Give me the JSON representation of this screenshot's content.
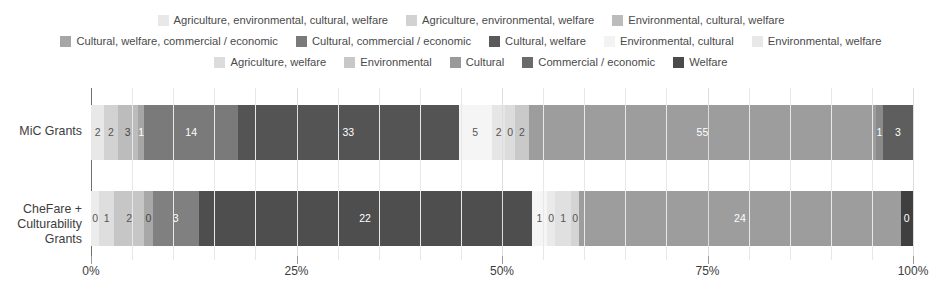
{
  "legend": {
    "rows": [
      [
        {
          "label": "Agriculture, environmental, cultural, welfare",
          "color": "#e8e8e8"
        },
        {
          "label": "Agriculture, environmental, welfare",
          "color": "#d2d2d2"
        },
        {
          "label": "Environmental, cultural, welfare",
          "color": "#bcbcbc"
        }
      ],
      [
        {
          "label": "Cultural, welfare, commercial / economic",
          "color": "#a6a6a6"
        },
        {
          "label": "Cultural, commercial / economic",
          "color": "#7a7a7a"
        },
        {
          "label": "Cultural, welfare",
          "color": "#5a5a5a"
        },
        {
          "label": "Environmental, cultural",
          "color": "#f3f3f3"
        },
        {
          "label": "Environmental, welfare",
          "color": "#e8e8e8"
        }
      ],
      [
        {
          "label": "Agriculture, welfare",
          "color": "#dcdcdc"
        },
        {
          "label": "Environmental",
          "color": "#c8c8c8"
        },
        {
          "label": "Cultural",
          "color": "#9a9a9a"
        },
        {
          "label": "Commercial / economic",
          "color": "#6a6a6a"
        },
        {
          "label": "Welfare",
          "color": "#4a4a4a"
        }
      ]
    ]
  },
  "axis": {
    "y_labels": [
      "MiC Grants",
      "CheFare + Culturability Grants"
    ],
    "x_ticks": [
      "0%",
      "25%",
      "50%",
      "75%",
      "100%"
    ]
  },
  "chart_data": {
    "type": "bar",
    "orientation": "horizontal",
    "stacked": true,
    "normalized": true,
    "title": "",
    "xlabel": "",
    "ylabel": "",
    "xlim": [
      0,
      100
    ],
    "grid": true,
    "legend_position": "top",
    "categories": [
      "MiC Grants",
      "CheFare + Culturability Grants"
    ],
    "series": [
      {
        "name": "Agriculture, environmental, cultural, welfare",
        "color": "#e8e8e8",
        "values": [
          2,
          0
        ]
      },
      {
        "name": "Agriculture, environmental, welfare",
        "color": "#d2d2d2",
        "values": [
          2,
          1
        ]
      },
      {
        "name": "Environmental, cultural, welfare",
        "color": "#bcbcbc",
        "values": [
          3,
          2
        ]
      },
      {
        "name": "Cultural, welfare, commercial / economic",
        "color": "#a6a6a6",
        "values": [
          1,
          0
        ]
      },
      {
        "name": "Cultural, commercial / economic",
        "color": "#7a7a7a",
        "values": [
          14,
          3
        ]
      },
      {
        "name": "Cultural, welfare",
        "color": "#5a5a5a",
        "values": [
          33,
          22
        ]
      },
      {
        "name": "Environmental, cultural",
        "color": "#f3f3f3",
        "values": [
          5,
          1
        ]
      },
      {
        "name": "Environmental, welfare",
        "color": "#e8e8e8",
        "values": [
          2,
          0
        ]
      },
      {
        "name": "Agriculture, welfare",
        "color": "#dcdcdc",
        "values": [
          0,
          1
        ]
      },
      {
        "name": "Environmental",
        "color": "#c8c8c8",
        "values": [
          2,
          0
        ]
      },
      {
        "name": "Cultural",
        "color": "#9a9a9a",
        "values": [
          55,
          24
        ]
      },
      {
        "name": "Commercial / economic",
        "color": "#6a6a6a",
        "values": [
          1,
          0
        ]
      },
      {
        "name": "Welfare",
        "color": "#4a4a4a",
        "values": [
          3,
          0
        ]
      }
    ]
  },
  "bars": [
    {
      "name": "MiC Grants",
      "segments": [
        {
          "label": "2",
          "value": 2,
          "color": "#e8e8e8",
          "text": "#555555",
          "pct": 1.626
        },
        {
          "label": "2",
          "value": 2,
          "color": "#d2d2d2",
          "text": "#555555",
          "pct": 1.626
        },
        {
          "label": "3",
          "value": 3,
          "color": "#bcbcbc",
          "text": "#444444",
          "pct": 2.439
        },
        {
          "label": "1",
          "value": 1,
          "color": "#a6a6a6",
          "text": "#ffffff",
          "pct": 0.813
        },
        {
          "label": "14",
          "value": 14,
          "color": "#7a7a7a",
          "text": "#ffffff",
          "pct": 11.382
        },
        {
          "label": "33",
          "value": 33,
          "color": "#545454",
          "text": "#ffffff",
          "pct": 26.829
        },
        {
          "label": "5",
          "value": 5,
          "color": "#f5f5f5",
          "text": "#555555",
          "pct": 4.065
        },
        {
          "label": "2",
          "value": 2,
          "color": "#e6e6e6",
          "text": "#555555",
          "pct": 1.626
        },
        {
          "label": "0",
          "value": 0,
          "color": "#dcdcdc",
          "text": "#555555",
          "pct": 1.22
        },
        {
          "label": "2",
          "value": 2,
          "color": "#c9c9c9",
          "text": "#555555",
          "pct": 1.626
        },
        {
          "label": "55",
          "value": 55,
          "color": "#9d9d9d",
          "text": "#ffffff",
          "pct": 42.276
        },
        {
          "label": "1",
          "value": 1,
          "color": "#8a8a8a",
          "text": "#ffffff",
          "pct": 0.813
        },
        {
          "label": "3",
          "value": 3,
          "color": "#5e5e5e",
          "text": "#ffffff",
          "pct": 3.659
        }
      ]
    },
    {
      "name": "CheFare + Culturability Grants",
      "segments": [
        {
          "label": "0",
          "value": 0,
          "color": "#ececec",
          "text": "#555555",
          "pct": 1.0
        },
        {
          "label": "1",
          "value": 1,
          "color": "#dedede",
          "text": "#555555",
          "pct": 1.8
        },
        {
          "label": "2",
          "value": 2,
          "color": "#c6c6c6",
          "text": "#555555",
          "pct": 3.7
        },
        {
          "label": "0",
          "value": 0,
          "color": "#a8a8a8",
          "text": "#444444",
          "pct": 1.0
        },
        {
          "label": "3",
          "value": 3,
          "color": "#808080",
          "text": "#ffffff",
          "pct": 5.6
        },
        {
          "label": "22",
          "value": 22,
          "color": "#4e4e4e",
          "text": "#ffffff",
          "pct": 40.5
        },
        {
          "label": "1",
          "value": 1,
          "color": "#f5f5f5",
          "text": "#555555",
          "pct": 1.9
        },
        {
          "label": "0",
          "value": 0,
          "color": "#eaeaea",
          "text": "#555555",
          "pct": 1.0
        },
        {
          "label": "1",
          "value": 1,
          "color": "#e0e0e0",
          "text": "#555555",
          "pct": 1.9
        },
        {
          "label": "0",
          "value": 0,
          "color": "#d4d4d4",
          "text": "#555555",
          "pct": 1.0
        },
        {
          "label": "24",
          "value": 24,
          "color": "#9d9d9d",
          "text": "#ffffff",
          "pct": 39.1
        },
        {
          "label": "0",
          "value": 0,
          "color": "#3f3f3f",
          "text": "#ffffff",
          "pct": 1.5
        }
      ]
    }
  ]
}
